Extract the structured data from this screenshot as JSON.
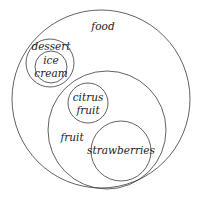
{
  "diagram": {
    "type": "euler-diagram",
    "sets": [
      {
        "id": "food",
        "label": "food",
        "cx": 101,
        "cy": 99,
        "r": 89,
        "label_lines": [
          {
            "text": "food",
            "x": 103,
            "y": 27
          }
        ]
      },
      {
        "id": "dessert",
        "label": "dessert",
        "cx": 50,
        "cy": 63,
        "r": 24,
        "parent": "food",
        "label_lines": [
          {
            "text": "dessert",
            "x": 51,
            "y": 47
          }
        ]
      },
      {
        "id": "ice-cream",
        "label": "ice cream",
        "cx": 51,
        "cy": 67,
        "r": 16,
        "parent": "dessert",
        "label_lines": [
          {
            "text": "ice",
            "x": 51,
            "y": 61
          },
          {
            "text": "cream",
            "x": 51,
            "y": 74
          }
        ]
      },
      {
        "id": "fruit",
        "label": "fruit",
        "cx": 107,
        "cy": 130,
        "r": 59,
        "parent": "food",
        "label_lines": [
          {
            "text": "fruit",
            "x": 72,
            "y": 138
          }
        ]
      },
      {
        "id": "citrus-fruit",
        "label": "citrus fruit",
        "cx": 88,
        "cy": 103,
        "r": 20,
        "parent": "fruit",
        "label_lines": [
          {
            "text": "citrus",
            "x": 88,
            "y": 98
          },
          {
            "text": "fruit",
            "x": 88,
            "y": 111
          }
        ]
      },
      {
        "id": "strawberries",
        "label": "strawberries",
        "cx": 121,
        "cy": 151,
        "r": 30,
        "parent": "fruit",
        "label_lines": [
          {
            "text": "strawberries",
            "x": 121,
            "y": 151
          }
        ]
      }
    ],
    "stroke_color": "#3a3a3a",
    "text_color": "#222222",
    "background": "#ffffff"
  }
}
